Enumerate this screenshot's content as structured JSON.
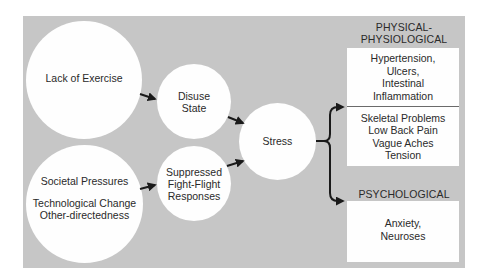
{
  "diagram": {
    "colors": {
      "background_panel": "#c6c6c6",
      "node_fill": "#fefefe",
      "arrow": "#1a1a1a",
      "text": "#2a2a2a"
    },
    "nodes": {
      "lack_of_exercise": {
        "label": "Lack of Exercise"
      },
      "societal": {
        "lines": [
          "Societal Pressures",
          "Technological Change",
          "Other-directedness"
        ]
      },
      "disuse_state": {
        "lines": [
          "Disuse",
          "State"
        ]
      },
      "suppressed": {
        "lines": [
          "Suppressed",
          "Fight-Flight",
          "Responses"
        ]
      },
      "stress": {
        "label": "Stress"
      }
    },
    "outcomes": {
      "physical": {
        "heading_lines": [
          "PHYSICAL-",
          "PHYSIOLOGICAL"
        ],
        "group1": [
          "Hypertension,",
          "Ulcers,",
          "Intestinal",
          "Inflammation"
        ],
        "group2": [
          "Skeletal Problems",
          "Low Back Pain",
          "Vague Aches",
          "Tension"
        ]
      },
      "psychological": {
        "heading": "PSYCHOLOGICAL",
        "items": [
          "Anxiety,",
          "Neuroses"
        ]
      }
    },
    "edges": [
      {
        "from": "Lack of Exercise",
        "to": "Disuse State"
      },
      {
        "from": "Societal Pressures / Technological Change / Other-directedness",
        "to": "Suppressed Fight-Flight Responses"
      },
      {
        "from": "Disuse State",
        "to": "Stress"
      },
      {
        "from": "Suppressed Fight-Flight Responses",
        "to": "Stress"
      },
      {
        "from": "Stress",
        "to": "PHYSICAL-PHYSIOLOGICAL"
      },
      {
        "from": "Stress",
        "to": "PSYCHOLOGICAL"
      }
    ]
  }
}
